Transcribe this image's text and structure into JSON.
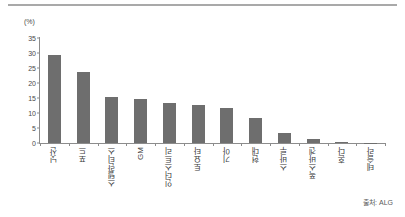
{
  "figure": {
    "top_rule": "horizontal-rule",
    "source_note": "출처: ALG"
  },
  "chart_data": {
    "type": "bar",
    "title": "",
    "subtitle": "",
    "xlabel": "",
    "ylabel": "(%)",
    "unit_label": "(%)",
    "ylim": [
      0,
      35
    ],
    "ytick_step": 5,
    "yticks": [
      "35",
      "30",
      "25",
      "20",
      "15",
      "10",
      "5",
      "0"
    ],
    "ytick_values": [
      35,
      30,
      25,
      20,
      15,
      10,
      5,
      0
    ],
    "grid": false,
    "legend": null,
    "bar_color": "#6e6e6e",
    "axis_color": "#8c8c8c",
    "categories": [
      "닛산",
      "포드",
      "스텔란티스",
      "GM",
      "인더스트리",
      "토요타",
      "기아",
      "현대",
      "스바루",
      "폭스바겐",
      "혼다",
      "테슬라"
    ],
    "values": [
      29.3,
      23.7,
      15.5,
      14.7,
      13.5,
      12.7,
      11.8,
      8.5,
      3.5,
      1.4,
      0.4,
      0.05
    ],
    "annotations": [
      "출처: ALG"
    ]
  }
}
